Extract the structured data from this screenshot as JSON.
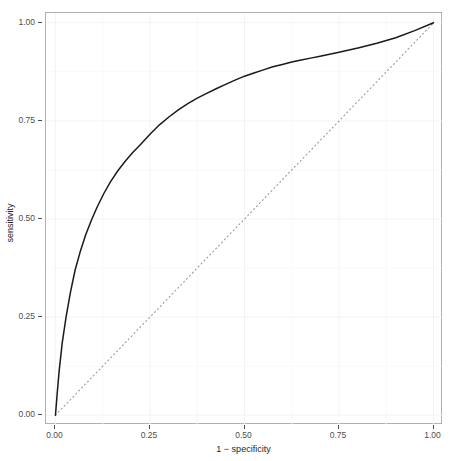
{
  "title": "",
  "axes": {
    "x": {
      "label": "1 − specificity",
      "ticks": [
        "0.00",
        "0.25",
        "0.50",
        "0.75",
        "1.00"
      ],
      "tick_values": [
        0,
        0.25,
        0.5,
        0.75,
        1
      ],
      "lim": [
        -0.025,
        1.025
      ]
    },
    "y": {
      "label": "sensitivity",
      "ticks": [
        "0.00",
        "0.25",
        "0.50",
        "0.75",
        "1.00"
      ],
      "tick_values": [
        0,
        0.25,
        0.5,
        0.75,
        1
      ],
      "lim": [
        -0.025,
        1.025
      ]
    }
  },
  "colors": {
    "curve": "#1a1a1a",
    "reference_line": "#9a9a9a",
    "panel_border": "#b0b0b0",
    "grid_major": "#f2f2f2",
    "grid_minor": "#f8f8f8",
    "axis_text": "#4d4d4d",
    "axis_title": "#262626",
    "background": "#ffffff"
  },
  "chart_data": {
    "type": "line",
    "title": "",
    "xlabel": "1 − specificity",
    "ylabel": "sensitivity",
    "xlim": [
      0,
      1
    ],
    "ylim": [
      0,
      1
    ],
    "grid": true,
    "legend": "none",
    "series": [
      {
        "name": "ROC curve",
        "style": "solid",
        "color": "#1a1a1a",
        "x": [
          0.0,
          0.005,
          0.01,
          0.018,
          0.028,
          0.04,
          0.052,
          0.065,
          0.08,
          0.095,
          0.11,
          0.128,
          0.145,
          0.165,
          0.185,
          0.205,
          0.225,
          0.25,
          0.275,
          0.3,
          0.325,
          0.35,
          0.375,
          0.4,
          0.425,
          0.45,
          0.475,
          0.5,
          0.525,
          0.55,
          0.575,
          0.6,
          0.625,
          0.65,
          0.675,
          0.7,
          0.725,
          0.75,
          0.8,
          0.85,
          0.9,
          0.95,
          1.0
        ],
        "y": [
          0.0,
          0.06,
          0.115,
          0.185,
          0.25,
          0.315,
          0.37,
          0.415,
          0.46,
          0.497,
          0.53,
          0.565,
          0.594,
          0.623,
          0.648,
          0.67,
          0.69,
          0.716,
          0.74,
          0.76,
          0.778,
          0.794,
          0.808,
          0.82,
          0.832,
          0.843,
          0.854,
          0.864,
          0.872,
          0.88,
          0.888,
          0.894,
          0.9,
          0.905,
          0.91,
          0.915,
          0.92,
          0.925,
          0.936,
          0.948,
          0.962,
          0.98,
          1.0
        ]
      },
      {
        "name": "chance line",
        "style": "dotted",
        "color": "#9a9a9a",
        "x": [
          0,
          1
        ],
        "y": [
          0,
          1
        ]
      }
    ]
  }
}
